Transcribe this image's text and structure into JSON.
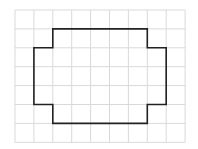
{
  "diagram": {
    "type": "grid-polygon",
    "grid": {
      "columns": 9,
      "rows": 7,
      "origin_px": [
        15,
        10
      ],
      "cell_px": 18.9,
      "line_color": "#d9d9d9"
    },
    "shape": {
      "stroke_color": "#222222",
      "vertices_cells": [
        [
          2,
          1
        ],
        [
          7,
          1
        ],
        [
          7,
          2
        ],
        [
          8,
          2
        ],
        [
          8,
          5
        ],
        [
          7,
          5
        ],
        [
          7,
          6
        ],
        [
          2,
          6
        ],
        [
          2,
          5
        ],
        [
          1,
          5
        ],
        [
          1,
          2
        ],
        [
          2,
          2
        ]
      ]
    }
  }
}
